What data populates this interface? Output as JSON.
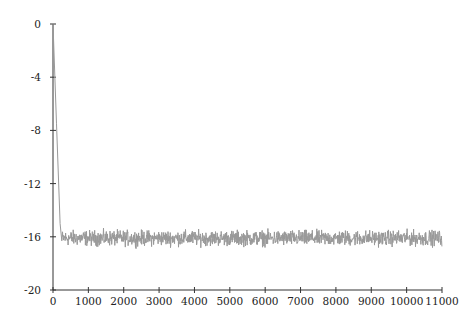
{
  "chart_data": {
    "type": "line",
    "title": "",
    "xlabel": "",
    "ylabel": "",
    "xlim": [
      0,
      11000
    ],
    "ylim": [
      -20,
      0
    ],
    "grid": false,
    "legend": null,
    "x_ticks": [
      0,
      1000,
      2000,
      3000,
      4000,
      5000,
      6000,
      7000,
      8000,
      9000,
      10000,
      11000
    ],
    "y_ticks": [
      0,
      -4,
      -8,
      -12,
      -16,
      -20
    ],
    "x_tick_labels": [
      "0",
      "1000",
      "2000",
      "3000",
      "4000",
      "5000",
      "6000",
      "7000",
      "8000",
      "9000",
      "10000",
      "11000"
    ],
    "y_tick_labels": [
      "0",
      "-4",
      "-8",
      "-12",
      "-16",
      "-20"
    ],
    "series": [
      {
        "name": "series",
        "color": "#999999",
        "description": "Starts at 0 at x=0, drops steeply to about -16.3 by x≈250, then fluctuates noisily around -16.1 (range approx -17 to -15.3) until x≈11000",
        "x": [
          0,
          50,
          100,
          150,
          200,
          250,
          500,
          1000,
          2000,
          3000,
          4000,
          5000,
          6000,
          7000,
          8000,
          9000,
          10000,
          11000
        ],
        "values": [
          0,
          -3.5,
          -7.5,
          -11.5,
          -15,
          -16.3,
          -16.1,
          -16.2,
          -16.2,
          -16.0,
          -16.1,
          -16.1,
          -16.1,
          -16.0,
          -16.1,
          -16.2,
          -16.0,
          -16.1
        ]
      }
    ],
    "noise_level": 0.35,
    "plateau": -16.1
  }
}
